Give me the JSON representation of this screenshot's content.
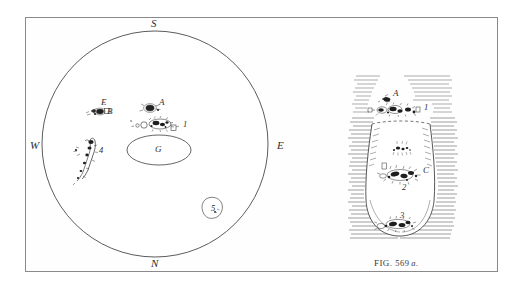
{
  "figure": {
    "caption_prefix": "FIG.",
    "caption_number": "569",
    "caption_suffix": "a.",
    "ink_color": "#2e2e2e",
    "frame_color": "#8a8a8a",
    "background_color": "#ffffff"
  },
  "solar_disk": {
    "compass": {
      "north": "N",
      "south": "S",
      "east": "E",
      "west": "W"
    },
    "central_region_label": "G",
    "spot_groups": [
      {
        "label": "E",
        "x": 101,
        "y": 100
      },
      {
        "label": "B",
        "x": 106,
        "y": 112
      },
      {
        "label": "A",
        "x": 159,
        "y": 100
      },
      {
        "label": "1",
        "x": 185,
        "y": 124
      },
      {
        "label": "4",
        "x": 100,
        "y": 150
      },
      {
        "label": "5",
        "x": 212,
        "y": 208
      }
    ]
  },
  "detail_view": {
    "spot_labels": [
      {
        "label": "A",
        "x": 396,
        "y": 93
      },
      {
        "label": "1",
        "x": 426,
        "y": 108
      },
      {
        "label": "C",
        "x": 425,
        "y": 170
      },
      {
        "label": "2",
        "x": 405,
        "y": 186
      },
      {
        "label": "3",
        "x": 402,
        "y": 219
      }
    ]
  }
}
